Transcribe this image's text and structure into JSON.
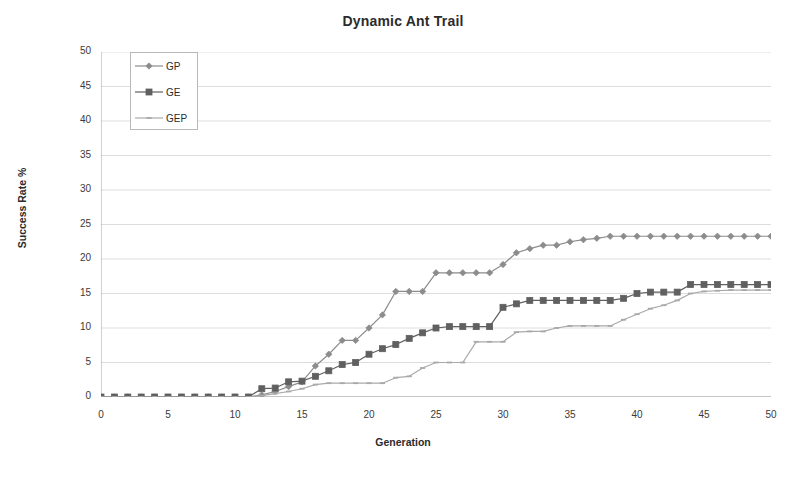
{
  "chart_data": {
    "type": "line",
    "title": "Dynamic Ant Trail",
    "xlabel": "Generation",
    "ylabel": "Success Rate %",
    "xlim": [
      0,
      50
    ],
    "ylim": [
      0,
      50
    ],
    "xticks": [
      0,
      5,
      10,
      15,
      20,
      25,
      30,
      35,
      40,
      45,
      50
    ],
    "yticks": [
      0,
      5,
      10,
      15,
      20,
      25,
      30,
      35,
      40,
      45,
      50
    ],
    "grid": "horizontal",
    "legend_position": "top-left",
    "x": [
      0,
      1,
      2,
      3,
      4,
      5,
      6,
      7,
      8,
      9,
      10,
      11,
      12,
      13,
      14,
      15,
      16,
      17,
      18,
      19,
      20,
      21,
      22,
      23,
      24,
      25,
      26,
      27,
      28,
      29,
      30,
      31,
      32,
      33,
      34,
      35,
      36,
      37,
      38,
      39,
      40,
      41,
      42,
      43,
      44,
      45,
      46,
      47,
      48,
      49,
      50
    ],
    "series": [
      {
        "name": "GP",
        "marker": "diamond",
        "color": "#8c8c8c",
        "values": [
          0,
          0,
          0,
          0,
          0,
          0,
          0,
          0,
          0,
          0,
          0,
          0,
          0.3,
          0.8,
          1.5,
          2.2,
          4.5,
          6.2,
          8.2,
          8.2,
          10.0,
          11.9,
          15.3,
          15.3,
          15.3,
          18.0,
          18.0,
          18.0,
          18.0,
          18.0,
          19.2,
          20.9,
          21.5,
          22.0,
          22.0,
          22.5,
          22.8,
          23.0,
          23.3,
          23.3,
          23.3,
          23.3,
          23.3,
          23.3,
          23.3,
          23.3,
          23.3,
          23.3,
          23.3,
          23.3,
          23.3
        ]
      },
      {
        "name": "GE",
        "marker": "square",
        "color": "#606060",
        "values": [
          0,
          0,
          0,
          0,
          0,
          0,
          0,
          0,
          0,
          0,
          0,
          0,
          1.2,
          1.3,
          2.2,
          2.3,
          3.0,
          3.8,
          4.7,
          5.0,
          6.2,
          7.0,
          7.6,
          8.5,
          9.3,
          10.0,
          10.2,
          10.2,
          10.2,
          10.2,
          13.0,
          13.5,
          14.0,
          14.0,
          14.0,
          14.0,
          14.0,
          14.0,
          14.0,
          14.3,
          15.0,
          15.2,
          15.2,
          15.2,
          16.3,
          16.3,
          16.3,
          16.3,
          16.3,
          16.3,
          16.3
        ]
      },
      {
        "name": "GEP",
        "marker": "dash",
        "color": "#a9a9a9",
        "values": [
          0,
          0,
          0,
          0,
          0,
          0,
          0,
          0,
          0,
          0,
          0,
          0,
          0.2,
          0.5,
          0.8,
          1.2,
          1.8,
          2.0,
          2.0,
          2.0,
          2.0,
          2.0,
          2.8,
          3.0,
          4.2,
          5.0,
          5.0,
          5.0,
          8.0,
          8.0,
          8.0,
          9.4,
          9.5,
          9.5,
          10.0,
          10.3,
          10.3,
          10.3,
          10.3,
          11.2,
          12.0,
          12.8,
          13.3,
          14.0,
          15.0,
          15.3,
          15.4,
          15.5,
          15.5,
          15.5,
          15.5
        ]
      }
    ]
  },
  "legend": {
    "items": [
      {
        "label": "GP"
      },
      {
        "label": "GE"
      },
      {
        "label": "GEP"
      }
    ]
  }
}
